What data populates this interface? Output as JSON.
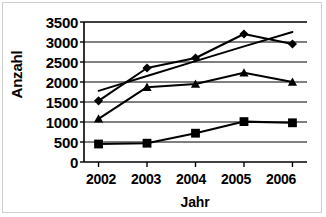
{
  "chart_data": {
    "type": "line",
    "title": "",
    "xlabel": "Jahr",
    "ylabel": "Anzahl",
    "categories": [
      "2002",
      "2003",
      "2004",
      "2005",
      "2006"
    ],
    "x": [
      2002,
      2003,
      2004,
      2005,
      2006
    ],
    "xlim": [
      2001.7,
      2006.3
    ],
    "ylim": [
      0,
      3500
    ],
    "yticks": [
      0,
      500,
      1000,
      1500,
      2000,
      2500,
      3000,
      3500
    ],
    "ytick_labels": [
      "0",
      "500",
      "1000",
      "1500",
      "2000",
      "2500",
      "3000",
      "3500"
    ],
    "grid": "horizontal",
    "legend": "none",
    "series": [
      {
        "name": "series-diamond",
        "marker": "diamond",
        "color": "#000000",
        "values": [
          1530,
          2350,
          2600,
          3200,
          2950
        ]
      },
      {
        "name": "series-square",
        "marker": "square",
        "color": "#000000",
        "values": [
          450,
          470,
          720,
          1010,
          980
        ]
      },
      {
        "name": "series-triangle",
        "marker": "triangle",
        "color": "#000000",
        "values": [
          1080,
          1870,
          1950,
          2230,
          2000
        ]
      },
      {
        "name": "series-trendline",
        "marker": "none",
        "color": "#000000",
        "values": [
          1780,
          2150,
          2520,
          2890,
          3250
        ]
      }
    ]
  },
  "axes": {
    "y_title": "Anzahl",
    "x_title": "Jahr",
    "y_tick_labels": [
      "3500",
      "3000",
      "2500",
      "2000",
      "1500",
      "1000",
      "500",
      "0"
    ],
    "x_tick_labels": [
      "2002",
      "2003",
      "2004",
      "2005",
      "2006"
    ]
  }
}
